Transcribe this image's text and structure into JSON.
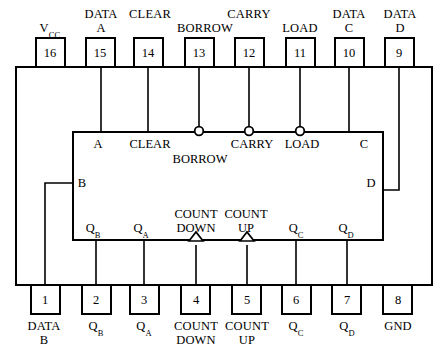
{
  "diagram": {
    "title": "",
    "device_type": "16-pin DIP up/down counter IC pinout",
    "stroke_color": "#000000",
    "background_color": "#ffffff"
  },
  "top_pins": [
    {
      "number": "16",
      "label": "V",
      "label_sub": "CC",
      "label_lines": [
        "VCC"
      ],
      "x": 50
    },
    {
      "number": "15",
      "label": "DATA A",
      "label_lines": [
        "DATA",
        "A"
      ],
      "x": 101
    },
    {
      "number": "14",
      "label": "CLEAR",
      "label_lines": [
        "CLEAR"
      ],
      "x": 148
    },
    {
      "number": "13",
      "label": "BORROW",
      "label_lines": [
        "BORROW"
      ],
      "x": 199
    },
    {
      "number": "12",
      "label": "CARRY",
      "label_lines": [
        "CARRY"
      ],
      "x": 249
    },
    {
      "number": "11",
      "label": "LOAD",
      "label_lines": [
        "LOAD"
      ],
      "x": 300
    },
    {
      "number": "10",
      "label": "DATA C",
      "label_lines": [
        "DATA",
        "C"
      ],
      "x": 349
    },
    {
      "number": "9",
      "label": "DATA D",
      "label_lines": [
        "DATA",
        "D"
      ],
      "x": 399
    }
  ],
  "bottom_pins": [
    {
      "number": "1",
      "label": "DATA B",
      "label_lines": [
        "DATA",
        "B"
      ],
      "x": 45
    },
    {
      "number": "2",
      "label": "QB",
      "label_lines": [
        "QB"
      ],
      "x": 96
    },
    {
      "number": "3",
      "label": "QA",
      "label_lines": [
        "QA"
      ],
      "x": 144
    },
    {
      "number": "4",
      "label": "COUNT DOWN",
      "label_lines": [
        "COUNT",
        "DOWN"
      ],
      "x": 196
    },
    {
      "number": "5",
      "label": "COUNT UP",
      "label_lines": [
        "COUNT",
        "UP"
      ],
      "x": 247
    },
    {
      "number": "6",
      "label": "QC",
      "label_lines": [
        "QC"
      ],
      "x": 296
    },
    {
      "number": "7",
      "label": "QD",
      "label_lines": [
        "QD"
      ],
      "x": 347
    },
    {
      "number": "8",
      "label": "GND",
      "label_lines": [
        "GND"
      ],
      "x": 398
    }
  ],
  "inner_block": {
    "top_labels": [
      {
        "text": "A",
        "x": 98
      },
      {
        "text": "CLEAR",
        "x": 150
      },
      {
        "text": "CARRY",
        "x": 252
      },
      {
        "text": "LOAD",
        "x": 302
      },
      {
        "text": "C",
        "x": 364
      }
    ],
    "borrow_label": {
      "text": "BORROW",
      "x": 200
    },
    "left_label": {
      "text": "B",
      "x": 82
    },
    "right_label": {
      "text": "D",
      "x": 371
    },
    "bottom_labels": [
      {
        "text": "QB",
        "x": 93
      },
      {
        "text": "QA",
        "x": 141
      },
      {
        "text": "COUNT DOWN",
        "lines": [
          "COUNT",
          "DOWN"
        ],
        "x": 196
      },
      {
        "text": "COUNT UP",
        "lines": [
          "COUNT",
          "UP"
        ],
        "x": 246
      },
      {
        "text": "QC",
        "x": 296
      },
      {
        "text": "QD",
        "x": 346
      }
    ]
  },
  "markers": {
    "inverting_bubbles": [
      {
        "name": "borrow-bubble",
        "x": 199,
        "y": 131
      },
      {
        "name": "carry-bubble",
        "x": 249,
        "y": 131
      },
      {
        "name": "load-bubble",
        "x": 300,
        "y": 131
      }
    ],
    "clock_triangles": [
      {
        "name": "count-down-clock",
        "x": 196,
        "y": 240
      },
      {
        "name": "count-up-clock",
        "x": 247,
        "y": 240
      }
    ]
  }
}
